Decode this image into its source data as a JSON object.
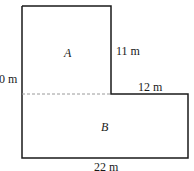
{
  "diagram": {
    "regions": [
      {
        "id": "A",
        "label": "A"
      },
      {
        "id": "B",
        "label": "B"
      }
    ],
    "dimensions": {
      "left_height": "20 m",
      "left_height_visible": "0 m",
      "top_right_vertical": "11 m",
      "step_horizontal": "12 m",
      "bottom_width": "22 m"
    },
    "colors": {
      "stroke": "#1a1a1a",
      "dashed": "#9a9a9a",
      "background": "#ffffff"
    }
  }
}
